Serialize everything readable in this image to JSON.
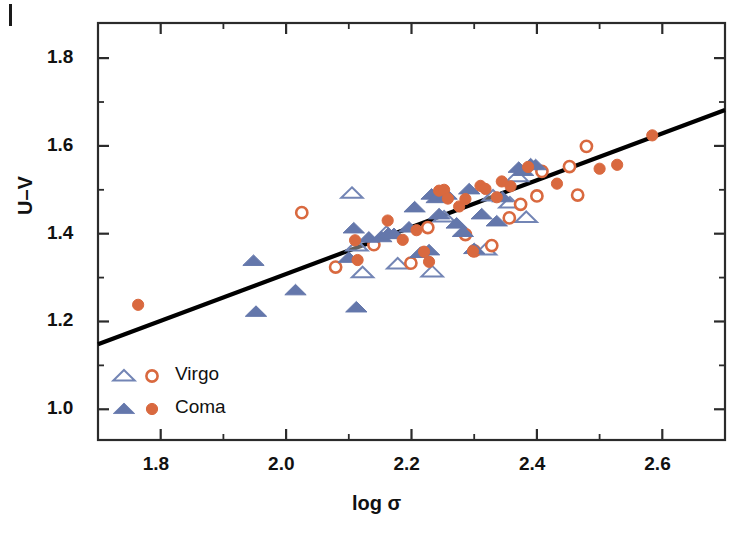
{
  "figure": {
    "corner_mark": "crop-corner-mark"
  },
  "chart_data": {
    "type": "scatter",
    "title": "",
    "xlabel": "log σ",
    "ylabel": "U–V",
    "xlim": [
      1.7,
      2.7
    ],
    "ylim": [
      0.93,
      1.88
    ],
    "xticks": [
      1.8,
      2.0,
      2.2,
      2.4,
      2.6
    ],
    "xtick_labels": [
      "1.8",
      "2.0",
      "2.2",
      "2.4",
      "2.6"
    ],
    "yticks": [
      1.0,
      1.2,
      1.4,
      1.6,
      1.8
    ],
    "ytick_labels": [
      "1.0",
      "1.2",
      "1.4",
      "1.6",
      "1.8"
    ],
    "xminorticks": [
      1.9,
      2.1,
      2.3,
      2.5
    ],
    "yminorticks": [
      1.1,
      1.3,
      1.5,
      1.7
    ],
    "grid": false,
    "legend_position": "lower-left",
    "colors": {
      "virgo_triangle": "#7385b5",
      "virgo_circle": "#d9693f",
      "coma_triangle": "#6477ab",
      "coma_circle": "#d9693f",
      "fit_line": "#000000",
      "axis": "#2b2b2b"
    },
    "legend": [
      {
        "label": "Virgo",
        "triangle_fill": "open",
        "circle_fill": "open"
      },
      {
        "label": "Coma",
        "triangle_fill": "filled",
        "circle_fill": "filled"
      }
    ],
    "fit_line": {
      "name": "best-fit relation",
      "x": [
        1.7,
        2.7
      ],
      "y": [
        1.148,
        1.682
      ],
      "slope": 0.534,
      "intercept": 0.24
    },
    "series": [
      {
        "name": "Virgo triangles",
        "marker": "open-triangle",
        "color": "#7385b5",
        "points": [
          [
            2.105,
            1.492
          ],
          [
            2.113,
            1.372
          ],
          [
            2.122,
            1.311
          ],
          [
            2.16,
            1.403
          ],
          [
            2.178,
            1.331
          ],
          [
            2.233,
            1.313
          ],
          [
            2.252,
            1.438
          ],
          [
            2.318,
            1.363
          ],
          [
            2.33,
            1.486
          ],
          [
            2.357,
            1.47
          ],
          [
            2.369,
            1.53
          ],
          [
            2.383,
            1.437
          ]
        ]
      },
      {
        "name": "Virgo circles",
        "marker": "open-circle",
        "color": "#d9693f",
        "points": [
          [
            2.025,
            1.448
          ],
          [
            2.079,
            1.324
          ],
          [
            2.14,
            1.375
          ],
          [
            2.199,
            1.333
          ],
          [
            2.226,
            1.414
          ],
          [
            2.286,
            1.398
          ],
          [
            2.3,
            1.361
          ],
          [
            2.328,
            1.373
          ],
          [
            2.356,
            1.436
          ],
          [
            2.374,
            1.467
          ],
          [
            2.4,
            1.486
          ],
          [
            2.408,
            1.542
          ],
          [
            2.452,
            1.553
          ],
          [
            2.465,
            1.488
          ],
          [
            2.479,
            1.599
          ]
        ]
      },
      {
        "name": "Coma triangles",
        "marker": "filled-triangle",
        "color": "#6477ab",
        "points": [
          [
            1.948,
            1.338
          ],
          [
            1.952,
            1.222
          ],
          [
            2.015,
            1.271
          ],
          [
            2.1,
            1.345
          ],
          [
            2.108,
            1.412
          ],
          [
            2.112,
            1.232
          ],
          [
            2.132,
            1.391
          ],
          [
            2.152,
            1.392
          ],
          [
            2.163,
            1.4
          ],
          [
            2.172,
            1.399
          ],
          [
            2.196,
            1.414
          ],
          [
            2.205,
            1.46
          ],
          [
            2.214,
            1.356
          ],
          [
            2.228,
            1.362
          ],
          [
            2.232,
            1.489
          ],
          [
            2.24,
            1.481
          ],
          [
            2.244,
            1.444
          ],
          [
            2.256,
            1.489
          ],
          [
            2.272,
            1.423
          ],
          [
            2.282,
            1.404
          ],
          [
            2.292,
            1.501
          ],
          [
            2.3,
            1.365
          ],
          [
            2.312,
            1.444
          ],
          [
            2.336,
            1.428
          ],
          [
            2.345,
            1.483
          ],
          [
            2.371,
            1.55
          ],
          [
            2.378,
            1.543
          ],
          [
            2.39,
            1.558
          ],
          [
            2.398,
            1.556
          ]
        ]
      },
      {
        "name": "Coma circles",
        "marker": "filled-circle",
        "color": "#d9693f",
        "points": [
          [
            1.764,
            1.238
          ],
          [
            2.11,
            1.385
          ],
          [
            2.114,
            1.34
          ],
          [
            2.162,
            1.43
          ],
          [
            2.186,
            1.386
          ],
          [
            2.208,
            1.408
          ],
          [
            2.22,
            1.359
          ],
          [
            2.228,
            1.336
          ],
          [
            2.244,
            1.498
          ],
          [
            2.252,
            1.5
          ],
          [
            2.258,
            1.48
          ],
          [
            2.276,
            1.462
          ],
          [
            2.286,
            1.479
          ],
          [
            2.298,
            1.36
          ],
          [
            2.31,
            1.509
          ],
          [
            2.318,
            1.502
          ],
          [
            2.336,
            1.483
          ],
          [
            2.344,
            1.519
          ],
          [
            2.358,
            1.508
          ],
          [
            2.386,
            1.552
          ],
          [
            2.432,
            1.514
          ],
          [
            2.5,
            1.548
          ],
          [
            2.528,
            1.557
          ],
          [
            2.584,
            1.624
          ]
        ]
      }
    ]
  }
}
